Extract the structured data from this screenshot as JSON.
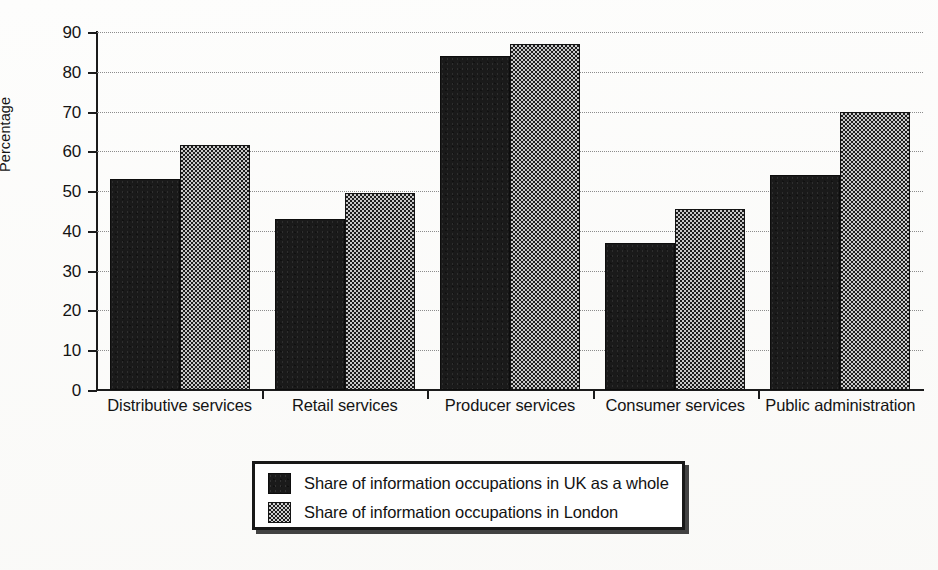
{
  "chart_data": {
    "type": "bar",
    "title": "",
    "xlabel": "",
    "ylabel": "Percentage",
    "ylim": [
      0,
      90
    ],
    "ytick_step": 10,
    "yticks": [
      0,
      10,
      20,
      30,
      40,
      50,
      60,
      70,
      80,
      90
    ],
    "ytick_labels": [
      "0",
      "10",
      "20",
      "30",
      "40",
      "50",
      "60",
      "70",
      "80",
      "90"
    ],
    "grid": true,
    "grid_style": "dotted-horizontal",
    "legend_position": "below-center",
    "categories": [
      "Distributive services",
      "Retail services",
      "Producer services",
      "Consumer services",
      "Public administration"
    ],
    "series": [
      {
        "name": "Share of information occupations in UK as a whole",
        "key": "uk",
        "color": "#1a1a1a",
        "fill": "solid-black",
        "values": [
          53,
          43,
          84,
          37,
          54
        ]
      },
      {
        "name": "Share of information occupations in London",
        "key": "london",
        "color": "#5a5a5a",
        "fill": "checkerboard-gray",
        "values": [
          61.5,
          49.5,
          87,
          45.5,
          70
        ]
      }
    ]
  },
  "axis": {
    "y_label": "Percentage"
  },
  "legend": {
    "entries": [
      {
        "label": "Share of information occupations in UK as a whole",
        "swatch": "uk"
      },
      {
        "label": "Share of information occupations in London",
        "swatch": "london"
      }
    ]
  }
}
